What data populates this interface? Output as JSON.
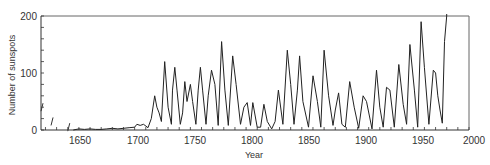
{
  "chart_data": {
    "type": "line",
    "title": "",
    "xlabel": "Year",
    "ylabel": "Number of sunspots",
    "xlim": [
      1616,
      2000
    ],
    "ylim": [
      0,
      200
    ],
    "x_ticks": [
      1650,
      1700,
      1750,
      1800,
      1850,
      1900,
      1950,
      2000
    ],
    "y_ticks": [
      0,
      100,
      200
    ],
    "grid": false,
    "legend": null,
    "series": [
      {
        "name": "Annual mean sunspot number",
        "x": [
          1645,
          1650,
          1655,
          1660,
          1665,
          1670,
          1675,
          1680,
          1685,
          1690,
          1695,
          1700,
          1702,
          1705,
          1708,
          1712,
          1715,
          1718,
          1720,
          1722,
          1724,
          1727,
          1730,
          1733,
          1734,
          1736,
          1738,
          1741,
          1743,
          1745,
          1747,
          1750,
          1752,
          1755,
          1757,
          1759,
          1761,
          1764,
          1766,
          1769,
          1772,
          1775,
          1778,
          1781,
          1784,
          1788,
          1791,
          1795,
          1798,
          1801,
          1804,
          1806,
          1810,
          1813,
          1816,
          1819,
          1823,
          1826,
          1829,
          1833,
          1837,
          1840,
          1843,
          1846,
          1848,
          1851,
          1856,
          1860,
          1864,
          1867,
          1870,
          1874,
          1878,
          1880,
          1883,
          1886,
          1889,
          1893,
          1897,
          1901,
          1905,
          1908,
          1913,
          1917,
          1920,
          1923,
          1926,
          1929,
          1933,
          1937,
          1941,
          1944,
          1947,
          1951,
          1954,
          1957,
          1960,
          1964,
          1968,
          1970,
          1972,
          1974,
          1976,
          1978,
          1980
        ],
        "y": [
          0,
          2,
          1,
          2,
          1,
          1,
          2,
          3,
          2,
          3,
          4,
          5,
          10,
          8,
          10,
          4,
          20,
          60,
          40,
          30,
          15,
          120,
          40,
          10,
          70,
          110,
          70,
          10,
          30,
          85,
          50,
          80,
          50,
          10,
          70,
          110,
          70,
          10,
          60,
          105,
          80,
          8,
          155,
          70,
          8,
          130,
          80,
          10,
          40,
          48,
          8,
          48,
          5,
          5,
          45,
          15,
          2,
          15,
          70,
          10,
          140,
          80,
          10,
          70,
          130,
          50,
          5,
          95,
          50,
          5,
          140,
          60,
          8,
          35,
          65,
          10,
          5,
          85,
          40,
          3,
          60,
          50,
          2,
          105,
          40,
          5,
          75,
          70,
          5,
          115,
          45,
          10,
          150,
          70,
          5,
          190,
          110,
          10,
          105,
          100,
          60,
          35,
          12,
          155,
          200
        ]
      }
    ],
    "annotations": [
      {
        "x": 1616,
        "y": 40,
        "type": "early-observation-stroke"
      },
      {
        "x": 1625,
        "y": 15,
        "type": "early-observation-stroke"
      },
      {
        "x": 1640,
        "y": 5,
        "type": "early-observation-stroke"
      }
    ]
  },
  "labels": {
    "xlabel": "Year",
    "ylabel": "Number of sunspots",
    "x_ticks": [
      "1650",
      "1700",
      "1750",
      "1800",
      "1850",
      "1900",
      "1950",
      "2000"
    ],
    "y_ticks": [
      "0",
      "100",
      "200"
    ]
  }
}
